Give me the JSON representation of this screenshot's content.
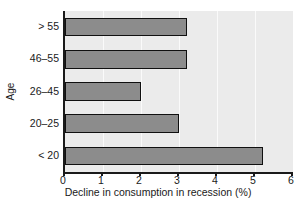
{
  "chart_data": {
    "type": "bar",
    "orientation": "horizontal",
    "title": "",
    "xlabel": "Decline in consumption in recession (%)",
    "ylabel": "Age",
    "categories": [
      "< 20",
      "20–25",
      "26–45",
      "46–55",
      "> 55"
    ],
    "values": [
      5.2,
      3.0,
      2.0,
      3.2,
      3.2
    ],
    "xlim": [
      0,
      6
    ],
    "xticks": [
      0,
      1,
      2,
      3,
      4,
      5,
      6
    ],
    "xticklabels": [
      "0",
      "1",
      "2",
      "3",
      "4",
      "5",
      "6"
    ],
    "grid": "vertical",
    "legend": "none",
    "series": [
      {
        "name": "Decline in consumption in recession (%)",
        "values": [
          5.2,
          3.0,
          2.0,
          3.2,
          3.2
        ]
      }
    ],
    "bar_color": "#8c8c8c",
    "bar_edge_color": "#101010",
    "plot_background": "#ebebeb",
    "gridline_color": "#fafafa",
    "axis_color": "#1a1a1a"
  }
}
